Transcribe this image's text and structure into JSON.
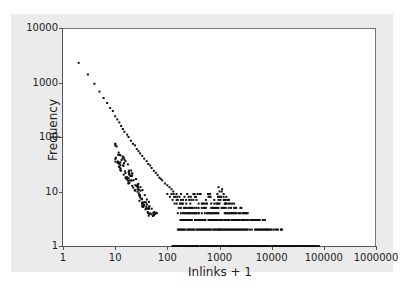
{
  "chart_data": {
    "type": "scatter",
    "title": "",
    "xlabel": "Inlinks + 1",
    "ylabel": "Frequency",
    "xscale": "log",
    "yscale": "log",
    "xlim": [
      1,
      1000000
    ],
    "ylim": [
      1,
      10000
    ],
    "grid": false,
    "legend": null,
    "x_ticks": [
      "1",
      "10",
      "100",
      "1000",
      "10000",
      "100000",
      "1000000"
    ],
    "y_ticks": [
      "1",
      "10",
      "100",
      "1000",
      "10000"
    ],
    "series": [
      {
        "name": "inlink distribution",
        "marker_color": "#111111",
        "points": [
          [
            2,
            2300
          ],
          [
            3,
            1400
          ],
          [
            4,
            950
          ],
          [
            5,
            680
          ],
          [
            6,
            520
          ],
          [
            7,
            420
          ],
          [
            8,
            340
          ],
          [
            9,
            300
          ],
          [
            10,
            240
          ],
          [
            11,
            210
          ],
          [
            12,
            185
          ],
          [
            13,
            160
          ],
          [
            14,
            140
          ],
          [
            15,
            125
          ],
          [
            17,
            110
          ],
          [
            18,
            100
          ],
          [
            20,
            85
          ],
          [
            22,
            75
          ],
          [
            24,
            70
          ],
          [
            26,
            60
          ],
          [
            28,
            55
          ],
          [
            30,
            50
          ],
          [
            33,
            45
          ],
          [
            36,
            40
          ],
          [
            40,
            36
          ],
          [
            43,
            32
          ],
          [
            47,
            30
          ],
          [
            50,
            27
          ],
          [
            55,
            24
          ],
          [
            60,
            22
          ],
          [
            65,
            20
          ],
          [
            70,
            18
          ],
          [
            75,
            17
          ],
          [
            80,
            16
          ],
          [
            90,
            14
          ],
          [
            100,
            13
          ],
          [
            110,
            12
          ],
          [
            120,
            11
          ],
          [
            130,
            10
          ],
          [
            150,
            9
          ],
          [
            170,
            8
          ],
          [
            200,
            7
          ],
          [
            230,
            6
          ],
          [
            270,
            5
          ],
          [
            300,
            5
          ],
          [
            350,
            4
          ],
          [
            400,
            4
          ],
          [
            500,
            3
          ],
          [
            700,
            3
          ],
          [
            1000,
            2
          ],
          [
            1100,
            10
          ],
          [
            1200,
            8
          ],
          [
            1300,
            6
          ],
          [
            1500,
            5
          ],
          [
            2000,
            4
          ],
          [
            3000,
            3
          ],
          [
            5000,
            3
          ],
          [
            8000,
            2
          ],
          [
            15000,
            2
          ],
          [
            30000,
            1
          ],
          [
            50000,
            1
          ],
          [
            80000,
            1
          ]
        ],
        "bands_note": "Horizontal runs of points at y=1..9 spanning x≈100–80000"
      }
    ]
  }
}
